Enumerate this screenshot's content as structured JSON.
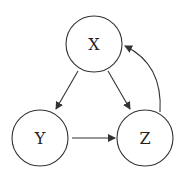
{
  "diagram": {
    "type": "directed-graph",
    "nodes": [
      {
        "id": "X",
        "label": "X"
      },
      {
        "id": "Y",
        "label": "Y"
      },
      {
        "id": "Z",
        "label": "Z"
      }
    ],
    "edges": [
      {
        "from": "X",
        "to": "Y"
      },
      {
        "from": "X",
        "to": "Z"
      },
      {
        "from": "Y",
        "to": "Z"
      },
      {
        "from": "Z",
        "to": "X",
        "curved": true
      }
    ],
    "stroke_color": "#333333",
    "background": "#ffffff"
  }
}
